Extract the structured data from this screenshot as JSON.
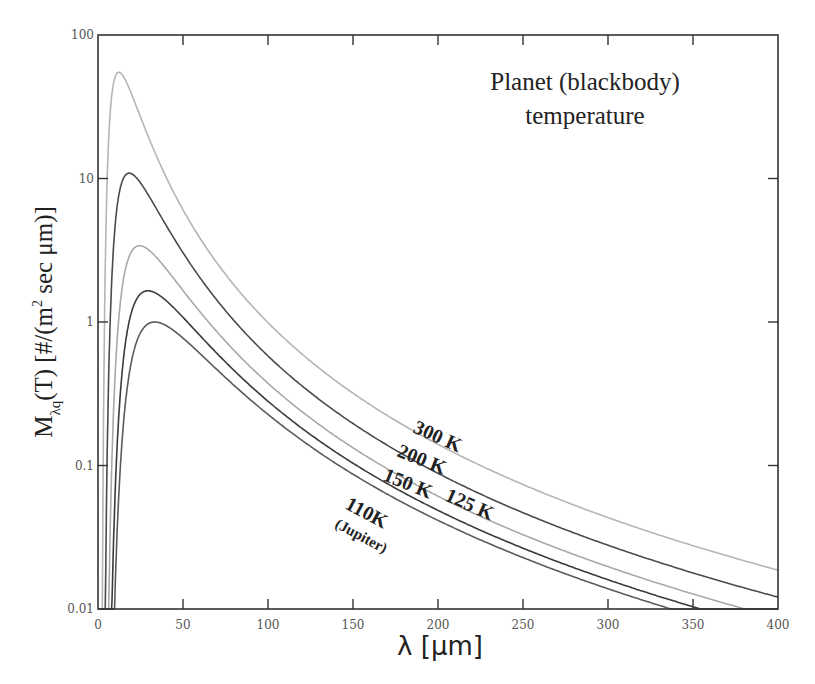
{
  "chart_data": {
    "type": "line",
    "title": "Planet (blackbody) temperature",
    "title_lines": [
      "Planet (blackbody)",
      "temperature"
    ],
    "xlabel": "λ [μm]",
    "ylabel": "M_λq(T) [#/(m² sec μm)]",
    "ylabel_parts": {
      "main": "M",
      "sub": "λq",
      "rest": "(T) [#/(m",
      "sup": "2",
      "tail": " sec μm)]"
    },
    "xlim": [
      0,
      400
    ],
    "ylim": [
      0.01,
      100
    ],
    "yscale": "log",
    "grid": false,
    "x_ticks": [
      0,
      50,
      100,
      150,
      200,
      250,
      300,
      350,
      400
    ],
    "x_tick_labels": [
      "0",
      "50",
      "100",
      "150",
      "200",
      "250",
      "300",
      "350",
      "400"
    ],
    "y_ticks": [
      0.01,
      0.1,
      1,
      10,
      100
    ],
    "y_tick_labels": [
      "0.01",
      "0.1",
      "1",
      "10",
      "100"
    ],
    "series": [
      {
        "name": "300 K",
        "temperature_K": 300,
        "peak_value": 55,
        "peak_wavelength_um": 12.2,
        "value_at_400um": 0.019,
        "color": "#b5b5b5"
      },
      {
        "name": "200 K",
        "temperature_K": 200,
        "peak_value": 10.9,
        "peak_wavelength_um": 18.4,
        "value_at_400um": 0.0125,
        "color": "#4a4a4a"
      },
      {
        "name": "150 K",
        "temperature_K": 150,
        "peak_value": 3.4,
        "peak_wavelength_um": 24.5,
        "reaches_ymin_at_um": 378,
        "color": "#a8a8a8"
      },
      {
        "name": "125 K",
        "temperature_K": 125,
        "peak_value": 1.65,
        "peak_wavelength_um": 29.4,
        "reaches_ymin_at_um": 352,
        "color": "#3a3a3a"
      },
      {
        "name": "110K (Jupiter)",
        "temperature_K": 110,
        "peak_value": 1.0,
        "peak_wavelength_um": 33.4,
        "reaches_ymin_at_um": 333,
        "color": "#5a5a5a"
      }
    ],
    "annotations": [
      {
        "text": "300 K",
        "x_um": 205,
        "y": 0.23
      },
      {
        "text": "200 K",
        "x_um": 195,
        "y": 0.13
      },
      {
        "text": "150 K",
        "x_um": 185,
        "y": 0.075
      },
      {
        "text": "125 K",
        "x_um": 225,
        "y": 0.045
      },
      {
        "text": "110K",
        "x_um": 165,
        "y": 0.045
      },
      {
        "text": "(Jupiter)",
        "x_um": 160,
        "y": 0.025
      }
    ]
  }
}
